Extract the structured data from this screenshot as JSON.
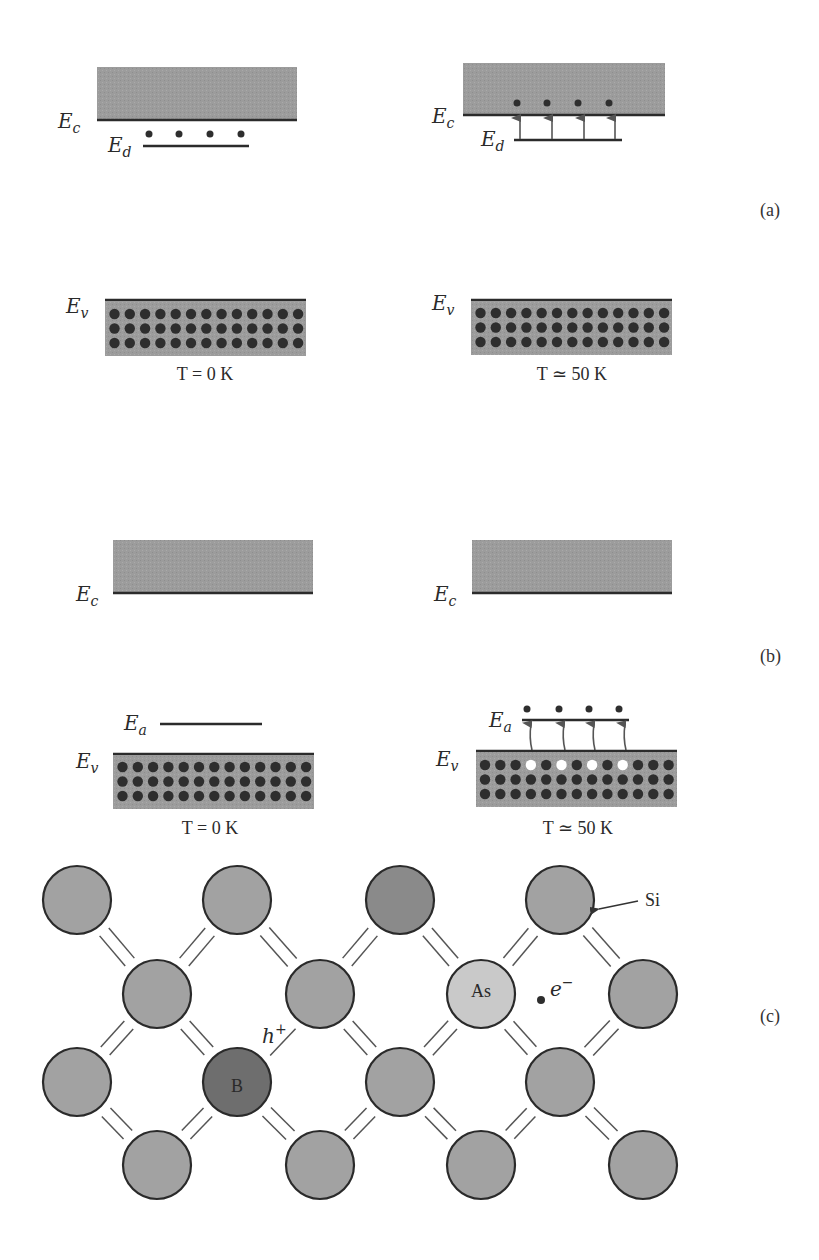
{
  "colors": {
    "band_fill": "#9a9a9a",
    "band_edge": "#2b2b2b",
    "electron": "#2e2e2e",
    "hole": "#ffffff",
    "si_atom": "#a2a2a2",
    "si_atom_dark": "#8a8a8a",
    "b_atom": "#6e6e6e",
    "as_atom": "#c9c9c9",
    "arrow": "#555555"
  },
  "panel_a": {
    "label": "(a)",
    "left": {
      "conduction_label": "E",
      "conduction_sub": "c",
      "donor_label": "E",
      "donor_sub": "d",
      "valence_label": "E",
      "valence_sub": "v",
      "temperature": "T = 0 K",
      "donor_electrons": 4,
      "valence_rows": 3,
      "valence_cols": 13
    },
    "right": {
      "conduction_label": "E",
      "conduction_sub": "c",
      "donor_label": "E",
      "donor_sub": "d",
      "valence_label": "E",
      "valence_sub": "v",
      "temperature": "T ≃ 50 K",
      "excited_electrons": 4,
      "valence_rows": 3,
      "valence_cols": 13
    }
  },
  "panel_b": {
    "label": "(b)",
    "left": {
      "conduction_label": "E",
      "conduction_sub": "c",
      "acceptor_label": "E",
      "acceptor_sub": "a",
      "valence_label": "E",
      "valence_sub": "v",
      "temperature": "T = 0 K",
      "valence_rows": 3,
      "valence_cols": 13
    },
    "right": {
      "conduction_label": "E",
      "conduction_sub": "c",
      "acceptor_label": "E",
      "acceptor_sub": "a",
      "valence_label": "E",
      "valence_sub": "v",
      "temperature": "T ≃ 50 K",
      "captured_electrons": 4,
      "hole_columns": [
        4,
        6,
        8,
        10
      ],
      "valence_rows": 3,
      "valence_cols": 13
    }
  },
  "panel_c": {
    "label": "(c)",
    "si_label": "Si",
    "boron_label": "B",
    "arsenic_label": "As",
    "hole_label": "h",
    "hole_sup": "+",
    "electron_label": "e",
    "electron_sup": "−"
  }
}
